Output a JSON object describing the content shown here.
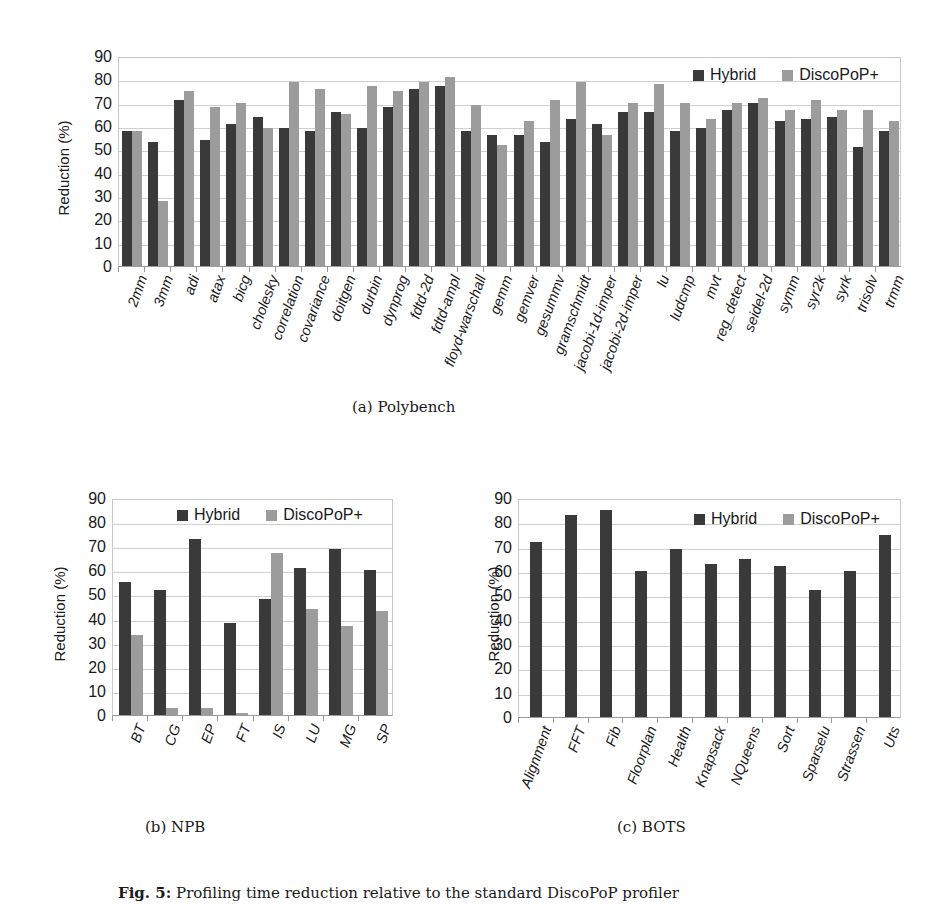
{
  "legend": {
    "hybrid": "Hybrid",
    "discopop": "DiscoPoP+",
    "hybrid_color": "#3a3a3a",
    "discopop_color": "#9c9c9c"
  },
  "ylabel": "Reduction (%)",
  "yticks": [
    "0",
    "10",
    "20",
    "30",
    "40",
    "50",
    "60",
    "70",
    "80",
    "90"
  ],
  "subcaptions": {
    "a": "(a) Polybench",
    "b": "(b) NPB",
    "c": "(c) BOTS"
  },
  "caption": {
    "label": "Fig. 5:",
    "text": "Profiling time reduction relative to the standard DiscoPoP profiler"
  },
  "chart_data": [
    {
      "type": "bar",
      "title": "(a) Polybench",
      "xlabel": "",
      "ylabel": "Reduction (%)",
      "ylim": [
        0,
        90
      ],
      "grid": true,
      "legend_position": "top-right",
      "categories": [
        "2mm",
        "3mm",
        "adi",
        "atax",
        "bicg",
        "cholesky",
        "correlation",
        "covariance",
        "doitgen",
        "durbin",
        "dynprog",
        "fdtd-2d",
        "fdtd-ampl",
        "floyd-warschall",
        "gemm",
        "gemver",
        "gesummv",
        "gramschmidt",
        "jacobi-1d-imper",
        "jacobi-2d-imper",
        "lu",
        "ludcmp",
        "mvt",
        "reg_detect",
        "seidel-2d",
        "symm",
        "syr2k",
        "syrk",
        "trisolv",
        "trmm"
      ],
      "series": [
        {
          "name": "Hybrid",
          "values": [
            58,
            53,
            71,
            54,
            61,
            64,
            59,
            58,
            66,
            59,
            68,
            76,
            77,
            58,
            56,
            56,
            53,
            63,
            61,
            66,
            66,
            58,
            59,
            67,
            70,
            62,
            63,
            64,
            51,
            58
          ]
        },
        {
          "name": "DiscoPoP+",
          "values": [
            58,
            28,
            75,
            68,
            70,
            59,
            79,
            76,
            65,
            77,
            75,
            79,
            81,
            69,
            52,
            62,
            71,
            79,
            56,
            70,
            78,
            70,
            63,
            70,
            72,
            67,
            71,
            67,
            67,
            62
          ]
        }
      ]
    },
    {
      "type": "bar",
      "title": "(b) NPB",
      "xlabel": "",
      "ylabel": "Reduction (%)",
      "ylim": [
        0,
        90
      ],
      "grid": true,
      "legend_position": "top-right",
      "categories": [
        "BT",
        "CG",
        "EP",
        "FT",
        "IS",
        "LU",
        "MG",
        "SP"
      ],
      "series": [
        {
          "name": "Hybrid",
          "values": [
            55,
            52,
            73,
            38,
            48,
            61,
            69,
            60
          ]
        },
        {
          "name": "DiscoPoP+",
          "values": [
            33,
            3,
            3,
            1,
            67,
            44,
            37,
            43
          ]
        }
      ]
    },
    {
      "type": "bar",
      "title": "(c) BOTS",
      "xlabel": "",
      "ylabel": "Reduction (%)",
      "ylim": [
        0,
        90
      ],
      "grid": true,
      "legend_position": "top-right",
      "categories": [
        "Alignment",
        "FFT",
        "Fib",
        "Floorplan",
        "Health",
        "Knapsack",
        "NQueens",
        "Sort",
        "Sparselu",
        "Strassen",
        "Uts"
      ],
      "series": [
        {
          "name": "Hybrid",
          "values": [
            72,
            83,
            85,
            60,
            69,
            63,
            65,
            62,
            52,
            60,
            75
          ]
        },
        {
          "name": "DiscoPoP+",
          "values": [
            0,
            0,
            0,
            0,
            0,
            0,
            0,
            0,
            0,
            0,
            0
          ]
        }
      ]
    }
  ]
}
